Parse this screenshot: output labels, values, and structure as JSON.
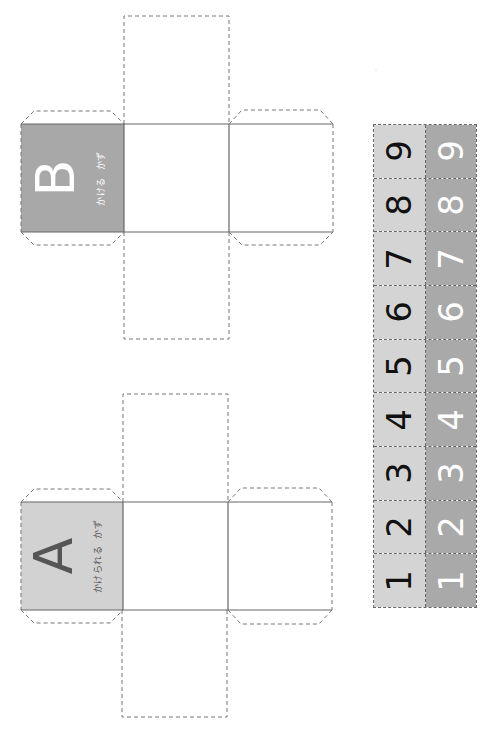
{
  "colors": {
    "face_a_fill": "#d2d2d2",
    "face_b_fill": "#a8a8a8",
    "strip_left_fill": "#d4d4d4",
    "strip_right_fill": "#a9a9a9",
    "solid_line": "#666666",
    "dashed_line": "#777777",
    "letter_a_color": "#555555",
    "letter_b_color": "#ffffff"
  },
  "cube_b": {
    "letter": "B",
    "caption_left": "かける",
    "caption_right": "かず"
  },
  "cube_a": {
    "letter": "A",
    "caption_left": "かけられる",
    "caption_right": "かず"
  },
  "number_strip": {
    "rows": [
      {
        "left": "9",
        "right": "9"
      },
      {
        "left": "8",
        "right": "8"
      },
      {
        "left": "7",
        "right": "7"
      },
      {
        "left": "6",
        "right": "6"
      },
      {
        "left": "5",
        "right": "5"
      },
      {
        "left": "4",
        "right": "4"
      },
      {
        "left": "3",
        "right": "3"
      },
      {
        "left": "2",
        "right": "2"
      },
      {
        "left": "1",
        "right": "1"
      }
    ]
  }
}
